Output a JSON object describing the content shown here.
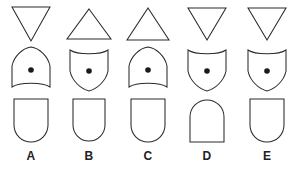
{
  "puzzle": {
    "type": "visual-analogy-multiple-choice",
    "option_count": 5,
    "row_count": 3,
    "stroke_color": "#2b2b2b",
    "dot_color": "#1a1a1a",
    "background_color": "#ffffff",
    "options": [
      {
        "label": "A",
        "top": {
          "icon": "triangle-down-icon",
          "name": "downward-triangle",
          "orientation": "down",
          "width": 38,
          "height": 34
        },
        "middle": {
          "icon": "shield-pointed-top-icon",
          "name": "shield-point-up-concave-bottom",
          "point": "top",
          "curve": "bottom-concave",
          "has_dot": true,
          "dot_position": "center"
        },
        "bottom": {
          "icon": "rounded-bottom-shape-icon",
          "name": "flat-top-rounded-bottom",
          "flat_edge": "top",
          "round_edge": "bottom"
        }
      },
      {
        "label": "B",
        "top": {
          "icon": "triangle-up-icon",
          "name": "upward-triangle",
          "orientation": "up",
          "width": 44,
          "height": 30
        },
        "middle": {
          "icon": "shield-pointed-bottom-icon",
          "name": "shield-point-down-concave-top",
          "point": "bottom",
          "curve": "top-concave",
          "has_dot": true,
          "dot_position": "center"
        },
        "bottom": {
          "icon": "rounded-bottom-shape-icon",
          "name": "flat-top-rounded-bottom",
          "flat_edge": "top",
          "round_edge": "bottom"
        }
      },
      {
        "label": "C",
        "top": {
          "icon": "triangle-up-icon",
          "name": "upward-triangle",
          "orientation": "up",
          "width": 42,
          "height": 32
        },
        "middle": {
          "icon": "shield-pointed-top-icon",
          "name": "shield-point-up-concave-bottom",
          "point": "top",
          "curve": "bottom-concave",
          "has_dot": true,
          "dot_position": "center"
        },
        "bottom": {
          "icon": "rounded-bottom-shape-icon",
          "name": "flat-top-rounded-bottom",
          "flat_edge": "top",
          "round_edge": "bottom"
        }
      },
      {
        "label": "D",
        "top": {
          "icon": "triangle-down-icon",
          "name": "downward-triangle",
          "orientation": "down",
          "width": 38,
          "height": 32
        },
        "middle": {
          "icon": "shield-pointed-bottom-icon",
          "name": "shield-point-down-concave-top",
          "point": "bottom",
          "curve": "top-concave",
          "has_dot": true,
          "dot_position": "center"
        },
        "bottom": {
          "icon": "rounded-top-shape-icon",
          "name": "rounded-top-flat-bottom",
          "flat_edge": "bottom",
          "round_edge": "top"
        }
      },
      {
        "label": "E",
        "top": {
          "icon": "triangle-down-icon",
          "name": "downward-triangle",
          "orientation": "down",
          "width": 38,
          "height": 32
        },
        "middle": {
          "icon": "shield-pointed-bottom-icon",
          "name": "shield-point-down-concave-top",
          "point": "bottom",
          "curve": "top-concave",
          "has_dot": true,
          "dot_position": "center"
        },
        "bottom": {
          "icon": "rounded-bottom-shape-icon",
          "name": "flat-top-rounded-bottom",
          "flat_edge": "top",
          "round_edge": "bottom"
        }
      }
    ]
  }
}
